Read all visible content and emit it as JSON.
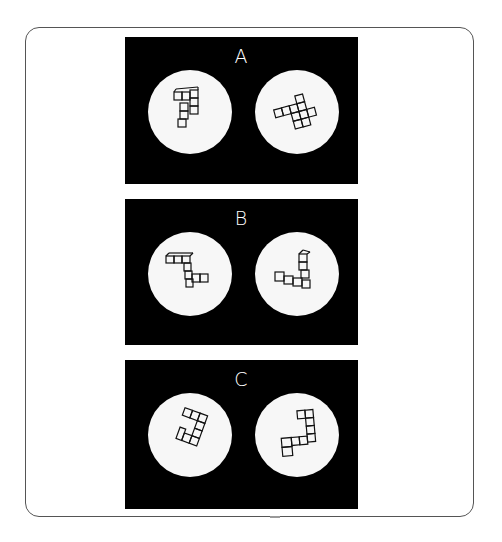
{
  "figure": {
    "panels": [
      {
        "label": "A",
        "left_figure": "l-shaped-block-figure",
        "right_figure": "rotated-block-figure"
      },
      {
        "label": "B",
        "left_figure": "zigzag-block-figure",
        "right_figure": "corner-block-figure"
      },
      {
        "label": "C",
        "left_figure": "hook-block-figure",
        "right_figure": "hook-block-figure-rotated"
      }
    ]
  },
  "colors": {
    "panel_background": "#000000",
    "disc": "#f7f7f7",
    "stroke": "#111111",
    "frame": "#555555"
  }
}
